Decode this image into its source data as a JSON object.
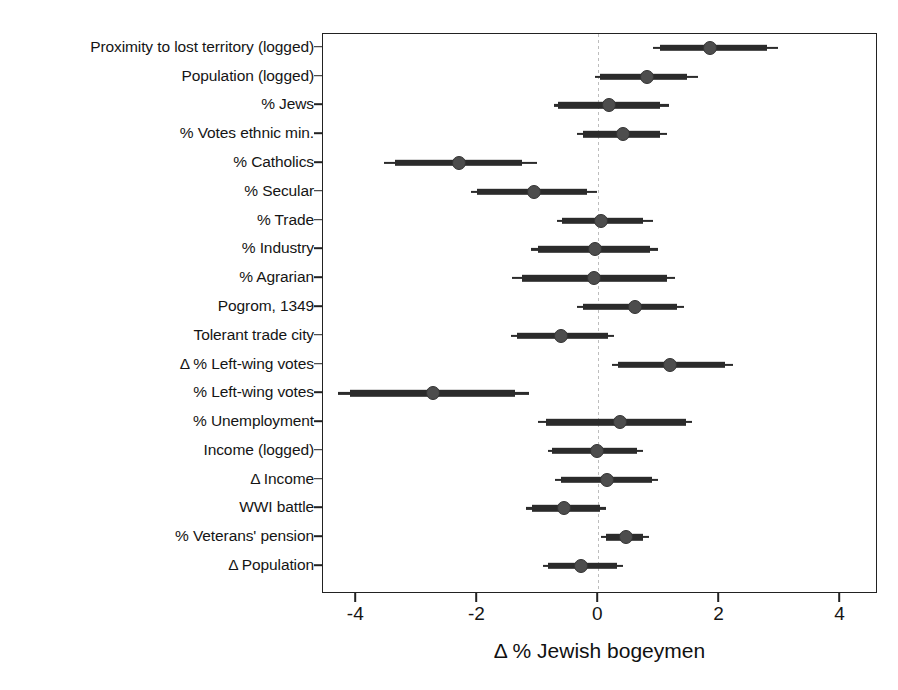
{
  "chart_data": {
    "type": "scatter",
    "title": "",
    "subtitle": "",
    "xlabel": "Δ % Jewish bogeymen",
    "ylabel": "",
    "xlim": [
      -4.55,
      4.62
    ],
    "xticks": [
      -4,
      -2,
      0,
      2,
      4
    ],
    "xticklabels": [
      "-4",
      "-2",
      "0",
      "2",
      "4"
    ],
    "grid": false,
    "legend": null,
    "zero_reference_line": 0,
    "interval_note": "Each row shows a point estimate with a thick (inner) and thin (outer) confidence interval.",
    "categories": [
      "Proximity to lost territory (logged)",
      "Population (logged)",
      "% Jews",
      "% Votes ethnic min.",
      "% Catholics",
      "% Secular",
      "% Trade",
      "% Industry",
      "% Agrarian",
      "Pogrom, 1349",
      "Tolerant trade city",
      "Δ % Left-wing votes",
      "% Left-wing votes",
      "% Unemployment",
      "Income (logged)",
      "Δ Income",
      "WWI battle",
      "% Veterans' pension",
      "Δ Population"
    ],
    "estimates": [
      {
        "label": "Proximity to lost territory (logged)",
        "point": 1.85,
        "inner_low": 1.02,
        "inner_high": 2.79,
        "outer_low": 0.91,
        "outer_high": 2.96
      },
      {
        "label": "Population (logged)",
        "point": 0.81,
        "inner_low": 0.03,
        "inner_high": 1.47,
        "outer_low": -0.05,
        "outer_high": 1.64
      },
      {
        "label": "% Jews",
        "point": 0.17,
        "inner_low": -0.66,
        "inner_high": 1.02,
        "outer_low": -0.74,
        "outer_high": 1.16
      },
      {
        "label": "% Votes ethnic min.",
        "point": 0.41,
        "inner_low": -0.26,
        "inner_high": 1.02,
        "outer_low": -0.35,
        "outer_high": 1.14
      },
      {
        "label": "% Catholics",
        "point": -2.3,
        "inner_low": -3.36,
        "inner_high": -1.26,
        "outer_low": -3.54,
        "outer_high": -1.01
      },
      {
        "label": "% Secular",
        "point": -1.07,
        "inner_low": -2.0,
        "inner_high": -0.18,
        "outer_low": -2.1,
        "outer_high": -0.02
      },
      {
        "label": "% Trade",
        "point": 0.05,
        "inner_low": -0.6,
        "inner_high": 0.74,
        "outer_low": -0.69,
        "outer_high": 0.91
      },
      {
        "label": "% Industry",
        "point": -0.05,
        "inner_low": -0.99,
        "inner_high": 0.86,
        "outer_low": -1.12,
        "outer_high": 0.98
      },
      {
        "label": "% Agrarian",
        "point": -0.08,
        "inner_low": -1.26,
        "inner_high": 1.13,
        "outer_low": -1.42,
        "outer_high": 1.27
      },
      {
        "label": "Pogrom, 1349",
        "point": 0.61,
        "inner_low": -0.26,
        "inner_high": 1.3,
        "outer_low": -0.36,
        "outer_high": 1.41
      },
      {
        "label": "Tolerant trade city",
        "point": -0.61,
        "inner_low": -1.34,
        "inner_high": 0.16,
        "outer_low": -1.45,
        "outer_high": 0.26
      },
      {
        "label": "Δ % Left-wing votes",
        "point": 1.19,
        "inner_low": 0.33,
        "inner_high": 2.1,
        "outer_low": 0.23,
        "outer_high": 2.23
      },
      {
        "label": "% Left-wing votes",
        "point": -2.73,
        "inner_low": -4.1,
        "inner_high": -1.37,
        "outer_low": -4.3,
        "outer_high": -1.14
      },
      {
        "label": "% Unemployment",
        "point": 0.35,
        "inner_low": -0.87,
        "inner_high": 1.44,
        "outer_low": -0.99,
        "outer_high": 1.55
      },
      {
        "label": "Income (logged)",
        "point": -0.02,
        "inner_low": -0.76,
        "inner_high": 0.63,
        "outer_low": -0.84,
        "outer_high": 0.73
      },
      {
        "label": "Δ Income",
        "point": 0.15,
        "inner_low": -0.62,
        "inner_high": 0.89,
        "outer_low": -0.71,
        "outer_high": 0.99
      },
      {
        "label": "WWI battle",
        "point": -0.56,
        "inner_low": -1.1,
        "inner_high": 0.03,
        "outer_low": -1.19,
        "outer_high": 0.12
      },
      {
        "label": "% Veterans' pension",
        "point": 0.45,
        "inner_low": 0.13,
        "inner_high": 0.74,
        "outer_low": 0.05,
        "outer_high": 0.83
      },
      {
        "label": "Δ Population",
        "point": -0.28,
        "inner_low": -0.83,
        "inner_high": 0.31,
        "outer_low": -0.91,
        "outer_high": 0.4
      }
    ],
    "colors": {
      "point": "#4d4d4d",
      "interval": "#2b2b2b",
      "axis": "#222222",
      "zero_line": "#bdbdbd",
      "background": "#ffffff"
    }
  }
}
